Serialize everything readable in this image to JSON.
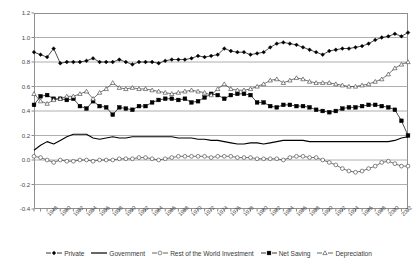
{
  "chart_data": {
    "type": "line",
    "title": "",
    "xlabel": "",
    "ylabel": "",
    "ylim": [
      -0.4,
      1.2
    ],
    "yticks": [
      "-0.4",
      "-0.2",
      "0.0",
      "0.2",
      "0.4",
      "0.6",
      "0.8",
      "1.0",
      "1.2"
    ],
    "ytick_values": [
      -0.4,
      -0.2,
      0.0,
      0.2,
      0.4,
      0.6,
      0.8,
      1.0,
      1.2
    ],
    "grid": "horizontal",
    "legend_position": "bottom",
    "xlim": [
      1946,
      2003
    ],
    "x": [
      1946,
      1947,
      1948,
      1949,
      1950,
      1951,
      1952,
      1953,
      1954,
      1955,
      1956,
      1957,
      1958,
      1959,
      1960,
      1961,
      1962,
      1963,
      1964,
      1965,
      1966,
      1967,
      1968,
      1969,
      1970,
      1971,
      1972,
      1973,
      1974,
      1975,
      1976,
      1977,
      1978,
      1979,
      1980,
      1981,
      1982,
      1983,
      1984,
      1985,
      1986,
      1987,
      1988,
      1989,
      1990,
      1991,
      1992,
      1993,
      1994,
      1995,
      1996,
      1997,
      1998,
      1999,
      2000,
      2001,
      2002,
      2003
    ],
    "xticks": [
      "1948",
      "1950",
      "1952",
      "1954",
      "1956",
      "1958",
      "1960",
      "1962",
      "1964",
      "1966",
      "1968",
      "1970",
      "1972",
      "1974",
      "1976",
      "1978",
      "1980",
      "1982",
      "1984",
      "1986",
      "1988",
      "1990",
      "1992",
      "1994",
      "1996",
      "1998",
      "2000",
      "2002"
    ],
    "xtick_values": [
      1948,
      1950,
      1952,
      1954,
      1956,
      1958,
      1960,
      1962,
      1964,
      1966,
      1968,
      1970,
      1972,
      1974,
      1976,
      1978,
      1980,
      1982,
      1984,
      1986,
      1988,
      1990,
      1992,
      1994,
      1996,
      1998,
      2000,
      2002
    ],
    "series": [
      {
        "name": "Private",
        "marker": "filled-diamond",
        "color": "#000000",
        "values": [
          0.88,
          0.86,
          0.84,
          0.91,
          0.79,
          0.8,
          0.8,
          0.8,
          0.81,
          0.83,
          0.8,
          0.8,
          0.8,
          0.82,
          0.8,
          0.78,
          0.8,
          0.8,
          0.8,
          0.79,
          0.81,
          0.82,
          0.82,
          0.82,
          0.83,
          0.85,
          0.84,
          0.85,
          0.86,
          0.91,
          0.89,
          0.88,
          0.88,
          0.86,
          0.87,
          0.88,
          0.92,
          0.95,
          0.96,
          0.95,
          0.94,
          0.92,
          0.9,
          0.88,
          0.86,
          0.89,
          0.9,
          0.91,
          0.91,
          0.92,
          0.93,
          0.95,
          0.98,
          1.0,
          1.01,
          1.03,
          1.01,
          1.04
        ]
      },
      {
        "name": "Government",
        "marker": "none",
        "color": "#000000",
        "values": [
          0.08,
          0.12,
          0.15,
          0.13,
          0.16,
          0.19,
          0.21,
          0.21,
          0.21,
          0.18,
          0.17,
          0.18,
          0.19,
          0.18,
          0.18,
          0.19,
          0.19,
          0.19,
          0.19,
          0.19,
          0.19,
          0.19,
          0.18,
          0.18,
          0.18,
          0.17,
          0.17,
          0.16,
          0.16,
          0.15,
          0.14,
          0.13,
          0.13,
          0.14,
          0.14,
          0.13,
          0.14,
          0.15,
          0.16,
          0.16,
          0.16,
          0.16,
          0.15,
          0.15,
          0.15,
          0.15,
          0.15,
          0.15,
          0.15,
          0.15,
          0.15,
          0.15,
          0.15,
          0.15,
          0.15,
          0.16,
          0.18,
          0.19
        ]
      },
      {
        "name": "Rest of the World Investment",
        "marker": "open-circle",
        "color": "#3a3a3a",
        "values": [
          0.03,
          0.02,
          0.0,
          -0.02,
          0.0,
          -0.01,
          -0.01,
          0.0,
          0.0,
          -0.01,
          0.0,
          0.0,
          0.0,
          0.01,
          0.01,
          0.01,
          0.02,
          0.02,
          0.01,
          0.0,
          0.01,
          0.02,
          0.03,
          0.03,
          0.03,
          0.03,
          0.03,
          0.02,
          0.03,
          0.03,
          0.03,
          0.02,
          0.02,
          0.02,
          0.01,
          0.01,
          0.01,
          0.01,
          0.0,
          0.02,
          0.03,
          0.03,
          0.02,
          0.02,
          0.0,
          -0.02,
          -0.04,
          -0.07,
          -0.09,
          -0.1,
          -0.09,
          -0.07,
          -0.05,
          -0.02,
          -0.01,
          -0.03,
          -0.05,
          -0.05
        ]
      },
      {
        "name": "Net Saving",
        "marker": "filled-square",
        "color": "#000000",
        "values": [
          0.45,
          0.52,
          0.53,
          0.5,
          0.5,
          0.49,
          0.5,
          0.44,
          0.42,
          0.48,
          0.44,
          0.43,
          0.37,
          0.43,
          0.42,
          0.41,
          0.44,
          0.44,
          0.47,
          0.49,
          0.5,
          0.5,
          0.49,
          0.5,
          0.47,
          0.48,
          0.51,
          0.54,
          0.53,
          0.5,
          0.53,
          0.54,
          0.54,
          0.53,
          0.47,
          0.47,
          0.44,
          0.43,
          0.45,
          0.45,
          0.44,
          0.44,
          0.43,
          0.41,
          0.4,
          0.39,
          0.4,
          0.42,
          0.43,
          0.43,
          0.44,
          0.45,
          0.45,
          0.44,
          0.43,
          0.41,
          0.32,
          0.2
        ]
      },
      {
        "name": "Depreciation",
        "marker": "open-triangle",
        "color": "#3a3a3a",
        "values": [
          0.54,
          0.48,
          0.46,
          0.49,
          0.5,
          0.52,
          0.52,
          0.54,
          0.56,
          0.5,
          0.55,
          0.58,
          0.63,
          0.59,
          0.58,
          0.59,
          0.58,
          0.58,
          0.57,
          0.56,
          0.55,
          0.54,
          0.55,
          0.56,
          0.57,
          0.56,
          0.55,
          0.53,
          0.58,
          0.62,
          0.58,
          0.57,
          0.57,
          0.58,
          0.6,
          0.62,
          0.65,
          0.66,
          0.63,
          0.65,
          0.67,
          0.66,
          0.64,
          0.63,
          0.63,
          0.63,
          0.62,
          0.61,
          0.6,
          0.6,
          0.61,
          0.62,
          0.64,
          0.66,
          0.7,
          0.75,
          0.78,
          0.8
        ]
      }
    ]
  },
  "legend": {
    "items": [
      {
        "label": "Private"
      },
      {
        "label": "Government"
      },
      {
        "label": "Rest of the World Investment"
      },
      {
        "label": "Net Saving"
      },
      {
        "label": "Depreciation"
      }
    ]
  }
}
